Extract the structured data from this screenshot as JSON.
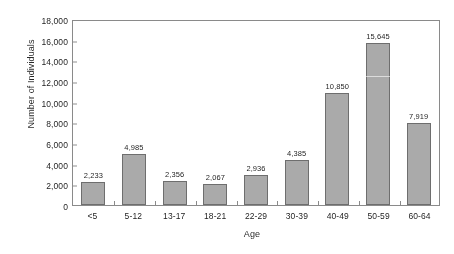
{
  "chart_data": {
    "type": "bar",
    "title": "",
    "xlabel": "Age",
    "ylabel": "Number of Individuals",
    "categories": [
      "<5",
      "5-12",
      "13-17",
      "18-21",
      "22-29",
      "30-39",
      "40-49",
      "50-59",
      "60-64"
    ],
    "values": [
      2233,
      4985,
      2356,
      2067,
      2936,
      4385,
      10850,
      15645,
      7919
    ],
    "value_labels": [
      "2,233",
      "4,985",
      "2,356",
      "2,067",
      "2,936",
      "4,385",
      "10,850",
      "15,645",
      "7,919"
    ],
    "ylim": [
      0,
      18000
    ],
    "ytick_values": [
      0,
      2000,
      4000,
      6000,
      8000,
      10000,
      12000,
      14000,
      16000,
      18000
    ],
    "ytick_labels": [
      "0",
      "2,000",
      "4,000",
      "6,000",
      "8,000",
      "10,000",
      "12,000",
      "14,000",
      "16,000",
      "18,000"
    ],
    "grid": false,
    "legend": false,
    "legend_position": "none",
    "bar_fill_color": "#a8a8a8",
    "bar_edge_color": "#6f6f6f",
    "axis_color": "#8a8a8a",
    "text_color": "#1f1f1f",
    "background_color": "#ffffff"
  }
}
